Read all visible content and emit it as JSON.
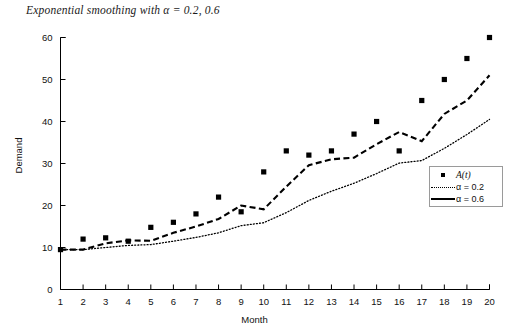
{
  "chart_data": {
    "type": "line",
    "title": "Exponential smoothing with α = 0.2, 0.6",
    "xlabel": "Month",
    "ylabel": "Demand",
    "xlim": [
      1,
      20
    ],
    "ylim": [
      0,
      60
    ],
    "xticks": [
      1,
      2,
      3,
      4,
      5,
      6,
      7,
      8,
      9,
      10,
      11,
      12,
      13,
      14,
      15,
      16,
      17,
      18,
      19,
      20
    ],
    "yticks": [
      0,
      10,
      20,
      30,
      40,
      50,
      60
    ],
    "grid": false,
    "legend_position": "right-middle",
    "x": [
      1,
      2,
      3,
      4,
      5,
      6,
      7,
      8,
      9,
      10,
      11,
      12,
      13,
      14,
      15,
      16,
      17,
      18,
      19,
      20
    ],
    "series": [
      {
        "name": "A(t)",
        "style": "scatter-square",
        "values": [
          9.5,
          12.0,
          12.3,
          11.5,
          14.8,
          16.0,
          18.0,
          22.0,
          18.5,
          28.0,
          33.0,
          32.0,
          33.0,
          37.0,
          40.0,
          33.0,
          45.0,
          50.0,
          55.0,
          60.0
        ]
      },
      {
        "name": "α = 0.2",
        "style": "dotted",
        "values": [
          9.5,
          9.5,
          10.0,
          10.5,
          10.7,
          11.5,
          12.4,
          13.5,
          15.2,
          15.9,
          18.3,
          21.2,
          23.4,
          25.3,
          27.6,
          30.1,
          30.7,
          33.6,
          36.9,
          40.5
        ]
      },
      {
        "name": "α = 0.6",
        "style": "dashed",
        "values": [
          9.5,
          9.5,
          11.0,
          11.7,
          11.6,
          13.5,
          15.0,
          16.8,
          20.0,
          19.1,
          24.5,
          29.6,
          31.0,
          31.4,
          34.6,
          37.5,
          35.3,
          41.8,
          45.0,
          51.0
        ]
      }
    ],
    "legend": [
      {
        "label": "A(t)",
        "marker": "square"
      },
      {
        "label": "α = 0.2",
        "marker": "dotted-line"
      },
      {
        "label": "α = 0.6",
        "marker": "dashed-line"
      }
    ]
  }
}
